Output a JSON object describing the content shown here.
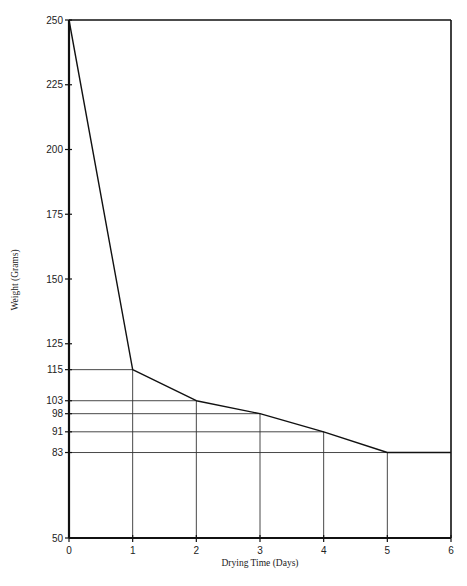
{
  "chart_data": {
    "type": "line",
    "title": "",
    "xlabel": "Drying Time (Days)",
    "ylabel": "Weight (Grams)",
    "x": [
      0,
      1,
      2,
      3,
      4,
      5,
      6
    ],
    "series": [
      {
        "name": "Weight",
        "values": [
          250,
          115,
          103,
          98,
          91,
          83,
          83
        ]
      }
    ],
    "xlim": [
      0,
      6
    ],
    "ylim": [
      50,
      250
    ],
    "x_ticks": [
      "0",
      "1",
      "2",
      "3",
      "4",
      "5",
      "6"
    ],
    "y_ticks": [
      "50",
      "83",
      "91",
      "98",
      "103",
      "115",
      "125",
      "150",
      "175",
      "200",
      "225",
      "250"
    ],
    "grid": false,
    "drop_lines": true,
    "legend": null,
    "frame": "box"
  }
}
